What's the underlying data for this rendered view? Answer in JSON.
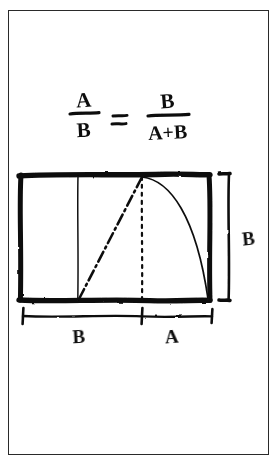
{
  "page": {
    "background_color": "#ffffff",
    "ink_color": "#111111",
    "frame_color": "#2a2a2a",
    "style": "hand-drawn pen sketch"
  },
  "equation": {
    "full_text": "A/B = B/(A+B)",
    "left_numerator": "A",
    "left_denominator": "B",
    "equals": "=",
    "right_numerator": "B",
    "right_denominator": "A+B"
  },
  "diagram": {
    "name": "golden-rectangle-construction",
    "rectangle": {
      "x": 19,
      "y": 175,
      "width": 191,
      "height": 125,
      "stroke": "#111111",
      "stroke_width": 5
    },
    "divider_line": {
      "description": "vertical line separating segment B from segment A",
      "x": 78,
      "y_top": 175,
      "y_bottom": 300,
      "style": "solid-thin"
    },
    "diagonal": {
      "description": "dash-dot diagonal from divider foot to apex",
      "from_x": 78,
      "from_y": 300,
      "to_x": 142,
      "to_y": 177,
      "style": "dash-dot"
    },
    "center_line": {
      "description": "dotted vertical from apex down to base",
      "x": 142,
      "y_top": 177,
      "y_bottom": 300,
      "style": "dotted"
    },
    "arc": {
      "description": "arc swept from apex to bottom right corner",
      "from_x": 142,
      "from_y": 177,
      "to_x": 210,
      "to_y": 300,
      "style": "solid-thin"
    }
  },
  "labels": {
    "height_label": "B",
    "bottom_left_segment": "B",
    "bottom_right_segment": "A"
  },
  "dimensions": {
    "vertical_bracket": {
      "name": "height-bracket-right",
      "x": 228,
      "y_top": 174,
      "y_bottom": 300
    },
    "horizontal_line": {
      "name": "width-dimension-line-bottom",
      "y": 316,
      "x_start": 23,
      "x_mid": 142,
      "x_end": 212
    }
  }
}
